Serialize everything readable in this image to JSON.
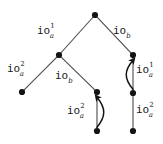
{
  "figure": {
    "type": "tree-diagram",
    "title": "",
    "background_color": "#ffffff",
    "node_color": "#141414",
    "edge_color": "#4a4a4a",
    "text_color": "#1a1a1a"
  },
  "nodes": [
    {
      "id": "root",
      "name": "node-root",
      "x": 95,
      "y": 15
    },
    {
      "id": "left",
      "name": "node-left",
      "x": 59,
      "y": 55
    },
    {
      "id": "right",
      "name": "node-right",
      "x": 133,
      "y": 55
    },
    {
      "id": "leftleaf",
      "name": "node-left-leaf",
      "x": 22,
      "y": 92
    },
    {
      "id": "mid",
      "name": "node-mid",
      "x": 97,
      "y": 92
    },
    {
      "id": "midbottom",
      "name": "node-mid-bottom",
      "x": 97,
      "y": 131
    },
    {
      "id": "rightmid",
      "name": "node-right-mid",
      "x": 133,
      "y": 93
    },
    {
      "id": "rightbottom",
      "name": "node-right-bottom",
      "x": 133,
      "y": 131
    }
  ],
  "edges": [
    {
      "id": "e1",
      "name": "edge-root-left",
      "from": "root",
      "to": "left",
      "style": "straight",
      "arrow": "none"
    },
    {
      "id": "e2",
      "name": "edge-root-right",
      "from": "root",
      "to": "right",
      "style": "straight",
      "arrow": "none"
    },
    {
      "id": "e3",
      "name": "edge-left-leftleaf",
      "from": "left",
      "to": "leftleaf",
      "style": "straight",
      "arrow": "none"
    },
    {
      "id": "e4",
      "name": "edge-left-mid",
      "from": "left",
      "to": "mid",
      "style": "straight",
      "arrow": "none"
    },
    {
      "id": "e5",
      "name": "edge-mid-midbottom",
      "from": "mid",
      "to": "midbottom",
      "style": "straight",
      "arrow": "none"
    },
    {
      "id": "e6",
      "name": "edge-right-rightmid",
      "from": "right",
      "to": "rightmid",
      "style": "straight",
      "arrow": "none"
    },
    {
      "id": "e7",
      "name": "edge-rightmid-rightbottom",
      "from": "rightmid",
      "to": "rightbottom",
      "style": "straight",
      "arrow": "none"
    },
    {
      "id": "a1",
      "name": "curved-arrow-mid-up",
      "from": "midbottom",
      "to": "mid",
      "style": "curved-right",
      "arrow": "up"
    },
    {
      "id": "a2",
      "name": "curved-arrow-right-up",
      "from": "rightmid",
      "to": "right",
      "style": "curved-left",
      "arrow": "up"
    }
  ],
  "labels": [
    {
      "id": "l1",
      "name": "label-io-a-1-top-left",
      "base": "io",
      "sup": "1",
      "sub": "a",
      "x": 37,
      "y": 24
    },
    {
      "id": "l2",
      "name": "label-io-b-top-right",
      "base": "io",
      "sup": "",
      "sub": "b",
      "x": 113,
      "y": 25
    },
    {
      "id": "l3",
      "name": "label-io-a-2-left",
      "base": "io",
      "sup": "2",
      "sub": "a",
      "x": 7,
      "y": 62
    },
    {
      "id": "l4",
      "name": "label-io-b-middle",
      "base": "io",
      "sup": "",
      "sub": "b",
      "x": 55,
      "y": 70
    },
    {
      "id": "l5",
      "name": "label-io-a-2-mid-bottom",
      "base": "io",
      "sup": "2",
      "sub": "a",
      "x": 67,
      "y": 104
    },
    {
      "id": "l6",
      "name": "label-io-a-1-right",
      "base": "io",
      "sup": "1",
      "sub": "a",
      "x": 136,
      "y": 63
    },
    {
      "id": "l7",
      "name": "label-io-a-2-right-bottom",
      "base": "io",
      "sup": "2",
      "sub": "a",
      "x": 136,
      "y": 103
    }
  ]
}
